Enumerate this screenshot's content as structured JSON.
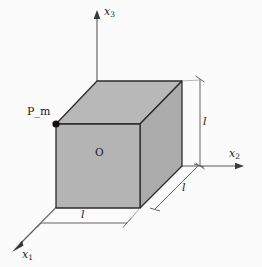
{
  "figure": {
    "type": "3d-geometry-diagram",
    "background_color": "#fbfbfb",
    "canvas": {
      "width": 262,
      "height": 267
    }
  },
  "axes": {
    "x1": {
      "label": "x",
      "subscript": "1",
      "direction": "down-left"
    },
    "x2": {
      "label": "x",
      "subscript": "2",
      "direction": "right"
    },
    "x3": {
      "label": "x",
      "subscript": "3",
      "direction": "up"
    },
    "color": "#4a4a4a"
  },
  "origin": {
    "label": "O"
  },
  "point": {
    "label": "P_m",
    "marker_color": "#111111"
  },
  "dimensions": [
    {
      "name": "edge-length-x1",
      "label": "l"
    },
    {
      "name": "edge-length-x2",
      "label": "l"
    },
    {
      "name": "edge-length-x3",
      "label": "l"
    }
  ],
  "cube": {
    "face_color": "#b4b4b4",
    "top_face_color": "#b9b9b9",
    "right_face_color": "#aeaeae",
    "edge_color": "#2b2b2b",
    "hidden_edge_style": "dashed"
  }
}
